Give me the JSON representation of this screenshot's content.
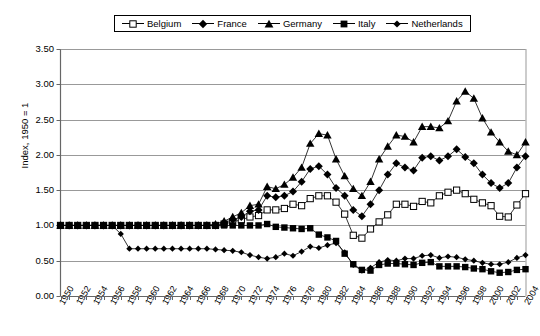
{
  "chart_data": {
    "type": "line",
    "title": "",
    "xlabel": "",
    "ylabel": "Index, 1950 = 1",
    "ylim": [
      0.0,
      3.5
    ],
    "ytick_step": 0.5,
    "yticks": [
      "0.00",
      "0.50",
      "1.00",
      "1.50",
      "2.00",
      "2.50",
      "3.00",
      "3.50"
    ],
    "xlim": [
      1950,
      2004
    ],
    "xtick_step": 2,
    "xticks": [
      "1950",
      "1952",
      "1954",
      "1956",
      "1958",
      "1960",
      "1962",
      "1964",
      "1966",
      "1968",
      "1970",
      "1972",
      "1974",
      "1976",
      "1978",
      "1980",
      "1982",
      "1984",
      "1986",
      "1988",
      "1990",
      "1992",
      "1994",
      "1996",
      "1998",
      "2000",
      "2002",
      "2004"
    ],
    "grid": "horizontal",
    "legend_position": "top-center",
    "x": [
      1950,
      1951,
      1952,
      1953,
      1954,
      1955,
      1956,
      1957,
      1958,
      1959,
      1960,
      1961,
      1962,
      1963,
      1964,
      1965,
      1966,
      1967,
      1968,
      1969,
      1970,
      1971,
      1972,
      1973,
      1974,
      1975,
      1976,
      1977,
      1978,
      1979,
      1980,
      1981,
      1982,
      1983,
      1984,
      1985,
      1986,
      1987,
      1988,
      1989,
      1990,
      1991,
      1992,
      1993,
      1994,
      1995,
      1996,
      1997,
      1998,
      1999,
      2000,
      2001,
      2002,
      2003,
      2004
    ],
    "series": [
      {
        "name": "Belgium",
        "marker": "open-square",
        "values": [
          1.0,
          1.0,
          1.0,
          1.0,
          1.0,
          1.0,
          1.0,
          1.0,
          1.0,
          1.0,
          1.0,
          1.0,
          1.0,
          1.0,
          1.0,
          1.0,
          1.0,
          1.0,
          1.0,
          1.02,
          1.05,
          1.08,
          1.12,
          1.14,
          1.22,
          1.22,
          1.24,
          1.3,
          1.28,
          1.38,
          1.42,
          1.42,
          1.33,
          1.16,
          0.86,
          0.82,
          0.95,
          1.05,
          1.15,
          1.3,
          1.3,
          1.27,
          1.34,
          1.32,
          1.42,
          1.47,
          1.5,
          1.45,
          1.37,
          1.32,
          1.28,
          1.13,
          1.12,
          1.29,
          1.45
        ]
      },
      {
        "name": "France",
        "marker": "filled-diamond",
        "values": [
          1.0,
          1.0,
          1.0,
          1.0,
          1.0,
          1.0,
          1.0,
          1.0,
          1.0,
          1.0,
          1.0,
          1.0,
          1.0,
          1.0,
          1.0,
          1.0,
          1.0,
          1.0,
          1.0,
          1.04,
          1.08,
          1.12,
          1.2,
          1.22,
          1.42,
          1.4,
          1.42,
          1.48,
          1.62,
          1.8,
          1.84,
          1.72,
          1.53,
          1.42,
          1.22,
          1.13,
          1.3,
          1.5,
          1.72,
          1.88,
          1.82,
          1.78,
          1.96,
          1.98,
          1.92,
          1.98,
          2.08,
          1.97,
          1.88,
          1.72,
          1.6,
          1.53,
          1.6,
          1.82,
          1.98
        ]
      },
      {
        "name": "Germany",
        "marker": "filled-triangle",
        "values": [
          1.0,
          1.0,
          1.0,
          1.0,
          1.0,
          1.0,
          1.0,
          1.0,
          1.0,
          1.0,
          1.0,
          1.0,
          1.0,
          1.0,
          1.0,
          1.0,
          1.0,
          1.0,
          1.02,
          1.06,
          1.12,
          1.18,
          1.28,
          1.3,
          1.55,
          1.52,
          1.58,
          1.68,
          1.82,
          2.16,
          2.3,
          2.28,
          1.94,
          1.7,
          1.52,
          1.42,
          1.62,
          1.94,
          2.12,
          2.28,
          2.26,
          2.18,
          2.4,
          2.4,
          2.38,
          2.48,
          2.76,
          2.9,
          2.8,
          2.52,
          2.32,
          2.18,
          2.05,
          2.0,
          2.18
        ]
      },
      {
        "name": "Italy",
        "marker": "filled-square",
        "values": [
          1.0,
          1.0,
          1.0,
          1.0,
          1.0,
          1.0,
          1.0,
          1.0,
          1.0,
          1.0,
          1.0,
          1.0,
          1.0,
          1.0,
          1.0,
          1.0,
          1.0,
          1.0,
          1.0,
          1.0,
          1.0,
          1.0,
          1.0,
          1.0,
          1.02,
          0.98,
          0.97,
          0.96,
          0.95,
          0.96,
          0.87,
          0.83,
          0.78,
          0.6,
          0.45,
          0.37,
          0.36,
          0.44,
          0.46,
          0.46,
          0.45,
          0.44,
          0.47,
          0.48,
          0.42,
          0.42,
          0.42,
          0.41,
          0.39,
          0.38,
          0.35,
          0.33,
          0.34,
          0.37,
          0.38
        ]
      },
      {
        "name": "Netherlands",
        "marker": "filled-diamond-small",
        "values": [
          1.0,
          1.0,
          1.0,
          1.0,
          1.0,
          1.0,
          1.0,
          0.88,
          0.67,
          0.67,
          0.67,
          0.67,
          0.67,
          0.67,
          0.67,
          0.67,
          0.67,
          0.67,
          0.66,
          0.65,
          0.64,
          0.62,
          0.58,
          0.55,
          0.53,
          0.55,
          0.6,
          0.57,
          0.63,
          0.7,
          0.68,
          0.72,
          0.75,
          0.62,
          0.44,
          0.36,
          0.4,
          0.48,
          0.51,
          0.5,
          0.53,
          0.53,
          0.57,
          0.58,
          0.54,
          0.56,
          0.55,
          0.52,
          0.5,
          0.47,
          0.45,
          0.45,
          0.48,
          0.54,
          0.58
        ]
      }
    ]
  },
  "colors": {
    "line": "#000000",
    "grid": "#999999",
    "axis": "#808080",
    "text": "#000000"
  }
}
